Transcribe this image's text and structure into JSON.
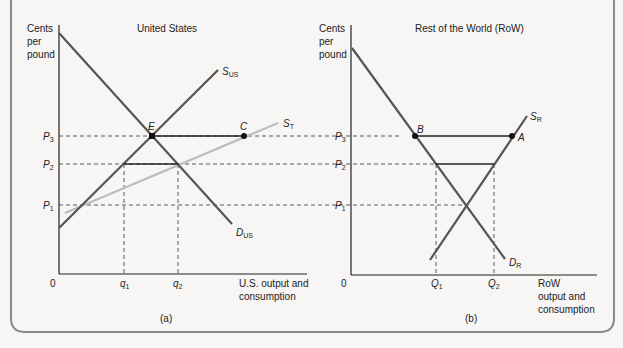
{
  "panel_a": {
    "title": "United States",
    "y_axis_label": [
      "Cents",
      "per",
      "pound"
    ],
    "x_axis_label": [
      "U.S. output and",
      "consumption"
    ],
    "origin": "0",
    "caption": "(a)",
    "price_labels": [
      {
        "base": "P",
        "sub": "3"
      },
      {
        "base": "P",
        "sub": "2"
      },
      {
        "base": "P",
        "sub": "1"
      }
    ],
    "quantity_labels": [
      {
        "base": "q",
        "sub": "1"
      },
      {
        "base": "q",
        "sub": "2"
      }
    ],
    "curves": [
      {
        "base": "S",
        "sub": "US",
        "name": "US supply"
      },
      {
        "base": "S",
        "sub": "T",
        "name": "Total supply"
      },
      {
        "base": "D",
        "sub": "US",
        "name": "US demand"
      }
    ],
    "points": [
      "E",
      "C"
    ]
  },
  "panel_b": {
    "title": "Rest of the World (RoW)",
    "y_axis_label": [
      "Cents",
      "per",
      "pound"
    ],
    "x_axis_label": [
      "RoW",
      "output and",
      "consumption"
    ],
    "origin": "0",
    "caption": "(b)",
    "price_labels": [
      {
        "base": "P",
        "sub": "3"
      },
      {
        "base": "P",
        "sub": "2"
      },
      {
        "base": "P",
        "sub": "1"
      }
    ],
    "quantity_labels": [
      {
        "base": "Q",
        "sub": "1"
      },
      {
        "base": "Q",
        "sub": "2"
      }
    ],
    "curves": [
      {
        "base": "S",
        "sub": "R",
        "name": "RoW supply"
      },
      {
        "base": "D",
        "sub": "R",
        "name": "RoW demand"
      }
    ],
    "points": [
      "B",
      "A"
    ]
  },
  "colors": {
    "curve": "#555555",
    "total_supply": "#bdbdbd",
    "guide": "#333333",
    "frame": "#8a8a8a"
  }
}
